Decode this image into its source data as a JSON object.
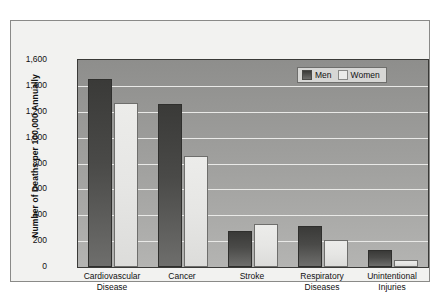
{
  "chart_data": {
    "type": "bar",
    "title": "",
    "xlabel": "",
    "ylabel": "Number of Deaths per 100,000 Annually",
    "ylim": [
      0,
      1600
    ],
    "yticks": [
      "0",
      "200",
      "400",
      "600",
      "800",
      "1,000",
      "1,200",
      "1,400",
      "1,600"
    ],
    "ytick_values": [
      0,
      200,
      400,
      600,
      800,
      1000,
      1200,
      1400,
      1600
    ],
    "grid": true,
    "legend_position": "top-right",
    "categories": [
      "Cardiovascular\nDisease",
      "Cancer",
      "Stroke",
      "Respiratory\nDiseases",
      "Unintentional\nInjuries"
    ],
    "category_lines": [
      [
        "Cardiovascular",
        "Disease"
      ],
      [
        "Cancer",
        ""
      ],
      [
        "Stroke",
        ""
      ],
      [
        "Respiratory",
        "Diseases"
      ],
      [
        "Unintentional",
        "Injuries"
      ]
    ],
    "series": [
      {
        "name": "Men",
        "color": "#3f3f3d",
        "values": [
          1450,
          1260,
          275,
          315,
          130
        ]
      },
      {
        "name": "Women",
        "color": "#ececea",
        "values": [
          1265,
          855,
          330,
          210,
          55
        ]
      }
    ]
  },
  "legend": {
    "items": [
      {
        "label": "Men"
      },
      {
        "label": "Women"
      }
    ]
  }
}
